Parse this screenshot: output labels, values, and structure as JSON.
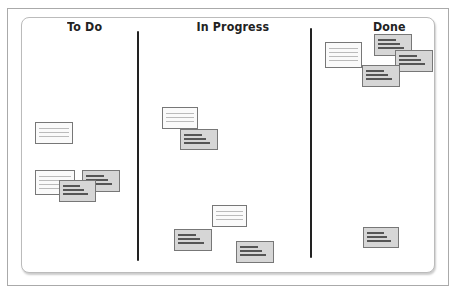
{
  "board": {
    "columns": [
      {
        "title": "To Do"
      },
      {
        "title": "In Progress"
      },
      {
        "title": "Done"
      }
    ]
  },
  "cards": [
    {
      "column": "To Do",
      "x": 35,
      "y": 122,
      "w": 38,
      "h": 22,
      "style": "light"
    },
    {
      "column": "To Do",
      "x": 35,
      "y": 170,
      "w": 40,
      "h": 25,
      "style": "light"
    },
    {
      "column": "To Do",
      "x": 82,
      "y": 170,
      "w": 38,
      "h": 22,
      "style": "dark"
    },
    {
      "column": "To Do",
      "x": 59,
      "y": 180,
      "w": 37,
      "h": 22,
      "style": "dark"
    },
    {
      "column": "In Progress",
      "x": 162,
      "y": 107,
      "w": 36,
      "h": 22,
      "style": "light"
    },
    {
      "column": "In Progress",
      "x": 180,
      "y": 129,
      "w": 38,
      "h": 21,
      "style": "dark"
    },
    {
      "column": "In Progress",
      "x": 212,
      "y": 205,
      "w": 35,
      "h": 22,
      "style": "light"
    },
    {
      "column": "In Progress",
      "x": 174,
      "y": 229,
      "w": 38,
      "h": 22,
      "style": "dark"
    },
    {
      "column": "In Progress",
      "x": 236,
      "y": 241,
      "w": 38,
      "h": 22,
      "style": "dark"
    },
    {
      "column": "Done",
      "x": 325,
      "y": 42,
      "w": 37,
      "h": 26,
      "style": "light"
    },
    {
      "column": "Done",
      "x": 374,
      "y": 34,
      "w": 38,
      "h": 22,
      "style": "dark"
    },
    {
      "column": "Done",
      "x": 395,
      "y": 50,
      "w": 38,
      "h": 22,
      "style": "dark"
    },
    {
      "column": "Done",
      "x": 362,
      "y": 65,
      "w": 38,
      "h": 22,
      "style": "dark"
    },
    {
      "column": "Done",
      "x": 363,
      "y": 227,
      "w": 36,
      "h": 21,
      "style": "dark"
    }
  ]
}
